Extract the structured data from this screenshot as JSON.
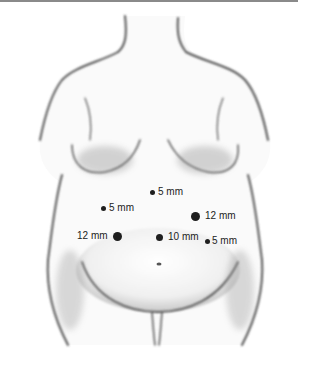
{
  "figure": {
    "colors": {
      "rule": "#8a8a8a",
      "outline": "#555555",
      "dot": "#1e1e1e",
      "text": "#222222"
    }
  },
  "ports": [
    {
      "id": "port-upper-midline",
      "label": "5 mm",
      "size": 5,
      "x": 153,
      "y": 191
    },
    {
      "id": "port-left-upper",
      "label": "5 mm",
      "size": 5,
      "x": 104,
      "y": 208
    },
    {
      "id": "port-right-upper",
      "label": "12 mm",
      "size": 12,
      "x": 195,
      "y": 216
    },
    {
      "id": "port-left-lower",
      "label": "12 mm",
      "size": 12,
      "x": 120,
      "y": 236
    },
    {
      "id": "port-midline-lower",
      "label": "10 mm",
      "size": 10,
      "x": 159,
      "y": 236
    },
    {
      "id": "port-right-lower",
      "label": "5 mm",
      "size": 5,
      "x": 207,
      "y": 240
    }
  ]
}
